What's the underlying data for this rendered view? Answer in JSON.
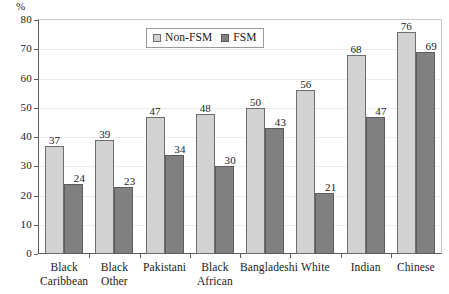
{
  "chart_data": {
    "type": "bar",
    "title": "",
    "subtitle": "",
    "xlabel": "",
    "ylabel": "%",
    "unit_label": "%",
    "ylim": [
      0,
      80
    ],
    "ytick_step": 10,
    "yticks": [
      0,
      10,
      20,
      30,
      40,
      50,
      60,
      70,
      80
    ],
    "grid": true,
    "legend_position": "top-center",
    "categories": [
      "Black Caribbean",
      "Black Other",
      "Pakistani",
      "Black African",
      "Bangladeshi",
      "White",
      "Indian",
      "Chinese"
    ],
    "category_lines": [
      [
        "Black",
        "Caribbean"
      ],
      [
        "Black",
        "Other"
      ],
      [
        "Pakistani"
      ],
      [
        "Black",
        "African"
      ],
      [
        "Bangladeshi"
      ],
      [
        "White"
      ],
      [
        "Indian"
      ],
      [
        "Chinese"
      ]
    ],
    "series": [
      {
        "name": "Non-FSM",
        "color": "#d2d2d2",
        "values": [
          37,
          39,
          47,
          48,
          50,
          56,
          68,
          76
        ]
      },
      {
        "name": "FSM",
        "color": "#808080",
        "values": [
          24,
          23,
          34,
          30,
          43,
          21,
          47,
          69
        ]
      }
    ]
  },
  "legend": {
    "items": [
      {
        "label": "Non-FSM"
      },
      {
        "label": "FSM"
      }
    ]
  },
  "colors": {
    "non_fsm": "#d2d2d2",
    "fsm": "#808080",
    "axis": "#5a5a5a",
    "grid": "#ededed",
    "frame": "#c8c8c8"
  }
}
